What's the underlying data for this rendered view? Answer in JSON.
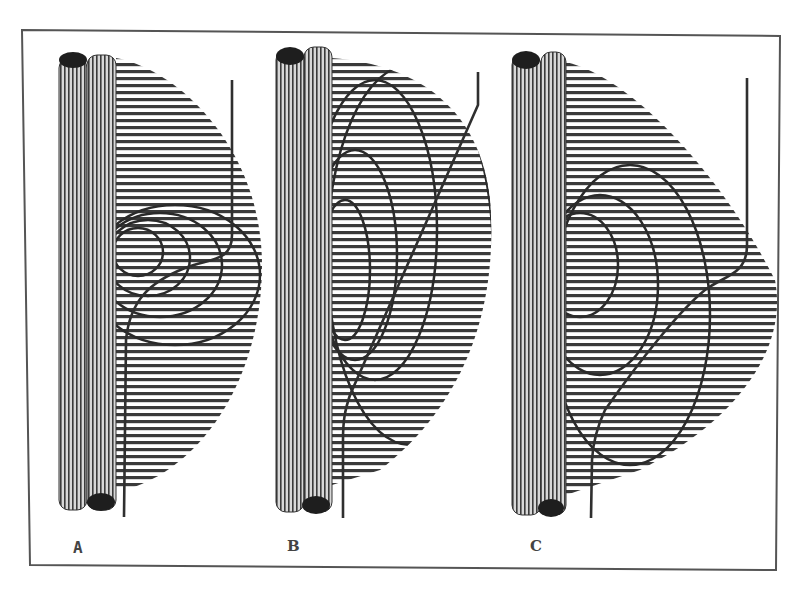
{
  "figure": {
    "panels": [
      {
        "id": "A",
        "label": "A",
        "contour_count": 4,
        "field_shape": "half-disc, compact"
      },
      {
        "id": "B",
        "label": "B",
        "contour_count": 4,
        "field_shape": "tall half-ellipse",
        "line": "straight diagonal"
      },
      {
        "id": "C",
        "label": "C",
        "contour_count": 3,
        "field_shape": "half-disc, elongated",
        "line": "S-curve"
      }
    ],
    "colors": {
      "frame": "#555555",
      "rod_stripe": "#333333",
      "rod_cap": "#1e1e1e",
      "hatch": "#3a3a3a",
      "contour": "#2a2a2a",
      "background": "#ffffff"
    }
  }
}
